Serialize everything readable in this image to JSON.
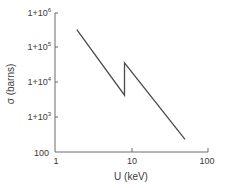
{
  "chart_data": {
    "type": "line",
    "title": "",
    "xlabel": "U (keV)",
    "ylabel": "σ (barns)",
    "xscale": "log",
    "yscale": "log",
    "xlim": [
      1,
      100
    ],
    "ylim": [
      100,
      1000000
    ],
    "xticks": [
      1,
      10,
      100
    ],
    "xtick_labels": [
      "1",
      "10",
      "100"
    ],
    "yticks": [
      100,
      1000,
      10000,
      100000,
      1000000
    ],
    "ytick_labels": [
      "100",
      "1+10³",
      "1+10⁴",
      "1+10⁵",
      "1+10⁶"
    ],
    "grid": false,
    "legend": null,
    "series": [
      {
        "name": "cross-section",
        "x": [
          1.93,
          8.1,
          8.1,
          50
        ],
        "y": [
          330000,
          4300,
          37000,
          230
        ]
      }
    ],
    "annotations": []
  },
  "labels": {
    "xlabel": "U (keV)",
    "ylabel": "σ (barns)",
    "x_ticks": [
      "1",
      "10",
      "100"
    ],
    "y_ticks": {
      "t100": "100",
      "t1e3_base": "1+10",
      "t1e3_exp": "3",
      "t1e4_base": "1+10",
      "t1e4_exp": "4",
      "t1e5_base": "1+10",
      "t1e5_exp": "5",
      "t1e6_base": "1+10",
      "t1e6_exp": "6"
    }
  },
  "colors": {
    "axis": "#6a6a6a",
    "line": "#4a4a4a",
    "text": "#3a3a3a",
    "background": "#ffffff"
  }
}
